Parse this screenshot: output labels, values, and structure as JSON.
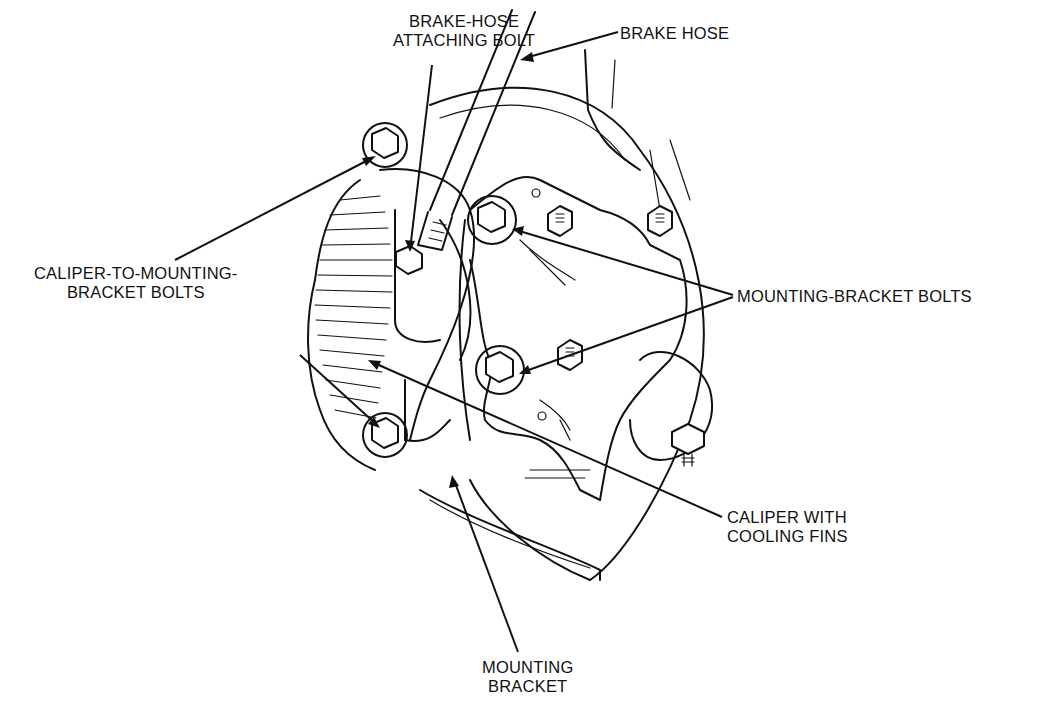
{
  "diagram": {
    "labels": {
      "brake_hose_attaching_bolt": [
        "BRAKE-HOSE",
        "ATTACHING BOLT"
      ],
      "brake_hose": [
        "BRAKE HOSE"
      ],
      "caliper_to_mounting_bracket_bolts": [
        "CALIPER-TO-MOUNTING-",
        "BRACKET BOLTS"
      ],
      "mounting_bracket_bolts": [
        "MOUNTING-BRACKET BOLTS"
      ],
      "caliper_with_cooling_fins": [
        "CALIPER WITH",
        "COOLING FINS"
      ],
      "mounting_bracket": [
        "MOUNTING",
        "BRACKET"
      ]
    }
  }
}
